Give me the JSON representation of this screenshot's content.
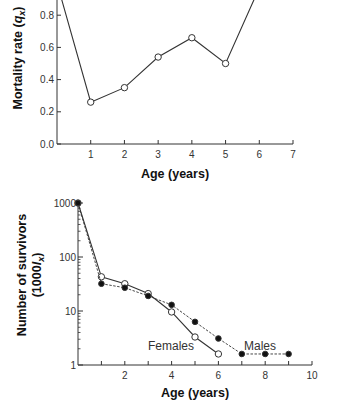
{
  "chart_data": [
    {
      "type": "line",
      "title": "",
      "xlabel": "Age (years)",
      "ylabel": "Mortality rate (q_x)",
      "ylabel_parts": {
        "text": "Mortality rate (",
        "var": "q",
        "sub": "x",
        "close": ")"
      },
      "xlim": [
        0,
        7
      ],
      "ylim": [
        0,
        0.8
      ],
      "x_ticks": [
        1,
        2,
        3,
        4,
        5,
        6,
        7
      ],
      "y_ticks": [
        0.0,
        0.2,
        0.4,
        0.6,
        0.8
      ],
      "y_tick_labels": [
        "0.0",
        "0.2",
        "0.4",
        "0.6",
        "0.8"
      ],
      "grid": false,
      "series": [
        {
          "name": "Mortality rate",
          "marker": "open-circle",
          "line": "solid",
          "x": [
            0,
            1,
            2,
            3,
            4,
            5,
            6
          ],
          "values": [
            1.0,
            0.26,
            0.35,
            0.54,
            0.66,
            0.5,
            0.97
          ],
          "markers_visible": [
            false,
            true,
            true,
            true,
            true,
            true,
            false
          ]
        }
      ]
    },
    {
      "type": "line",
      "title": "",
      "xlabel": "Age (years)",
      "ylabel": "Number of survivors (1000l_x)",
      "ylabel_line1": "Number of survivors",
      "ylabel_line2_parts": {
        "open": "(1000",
        "var": "l",
        "sub": "x",
        "close": ")"
      },
      "yscale": "log",
      "xlim": [
        0,
        10
      ],
      "ylim": [
        1,
        1000
      ],
      "x_ticks": [
        2,
        4,
        6,
        8,
        10
      ],
      "y_ticks": [
        1,
        10,
        100,
        1000
      ],
      "y_tick_labels": [
        "1",
        "10",
        "100",
        "1000"
      ],
      "grid": false,
      "legend": "inline labels",
      "series": [
        {
          "name": "Females",
          "marker": "open-circle",
          "line": "solid",
          "x": [
            0,
            1,
            2,
            3,
            4,
            5,
            6
          ],
          "values": [
            1000,
            43,
            32,
            21,
            9.6,
            3.3,
            1.6
          ]
        },
        {
          "name": "Males",
          "marker": "filled-circle",
          "line": "dashed",
          "x": [
            0,
            1,
            2,
            3,
            4,
            5,
            6,
            7,
            8,
            9
          ],
          "values": [
            1000,
            32,
            27,
            19,
            13,
            6.3,
            3.1,
            1.6,
            1.6,
            1.6
          ]
        }
      ]
    }
  ],
  "labels": {
    "females": "Females",
    "males": "Males"
  }
}
